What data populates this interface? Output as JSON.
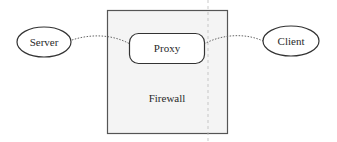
{
  "diagram": {
    "title": "",
    "nodes": {
      "server": {
        "label": "Server",
        "shape": "ellipse"
      },
      "proxy": {
        "label": "Proxy",
        "shape": "rounded-rectangle"
      },
      "client": {
        "label": "Client",
        "shape": "ellipse"
      },
      "firewall": {
        "label": "Firewall",
        "shape": "rectangle-container"
      }
    },
    "edges": [
      {
        "from": "server",
        "to": "proxy",
        "style": "dotted"
      },
      {
        "from": "proxy",
        "to": "client",
        "style": "dotted"
      }
    ],
    "colors": {
      "stroke": "#333333",
      "firewall_fill": "#f4f4f4",
      "firewall_border": "#555555",
      "dotted_line": "#666666",
      "divider_line": "#bbbbbb"
    }
  }
}
